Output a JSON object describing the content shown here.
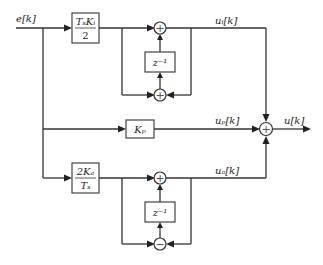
{
  "diagram": {
    "type": "block-diagram",
    "input_signal": "e[k]",
    "output_signal": "u[k]",
    "blocks": {
      "integral_gain": {
        "numerator": "TₛKᵢ",
        "denominator": "2"
      },
      "proportional_gain": {
        "label": "Kₚ"
      },
      "derivative_gain": {
        "numerator": "2Kₐ",
        "denominator": "Tₛ"
      },
      "delay_top": {
        "label": "z⁻¹"
      },
      "delay_bottom": {
        "label": "z⁻¹"
      }
    },
    "summing_junctions": {
      "integral_upper": "+",
      "integral_lower": "+",
      "derivative_upper": "+",
      "derivative_lower": "−",
      "output": "+"
    },
    "signals": {
      "ui": "uᵢ[k]",
      "up": "uₚ[k]",
      "ud": "uₐ[k]",
      "u": "u[k]",
      "e": "e[k]"
    }
  }
}
